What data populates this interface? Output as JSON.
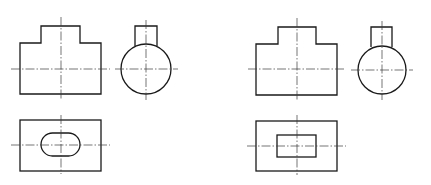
{
  "diagram": {
    "type": "orthographic-projection-comparison",
    "colors": {
      "outline": "#1a1a1a",
      "centerline": "#3a3a3a",
      "background": "#ffffff"
    },
    "drawings": [
      {
        "id": "left",
        "front_view": {
          "body": [
            20,
            43,
            101,
            94
          ],
          "boss": [
            41,
            26,
            80,
            43
          ],
          "cl_h": [
            11,
            69,
            110,
            69
          ],
          "cl_v": [
            61,
            17,
            61,
            99
          ]
        },
        "side_view": {
          "circle": [
            146,
            69,
            25
          ],
          "boss": [
            135,
            26,
            157,
            46
          ],
          "cl_h": [
            115,
            69,
            178,
            69
          ],
          "cl_v": [
            146,
            20,
            146,
            100
          ]
        },
        "top_view": {
          "rect": [
            20,
            120,
            101,
            171
          ],
          "hole": "slot",
          "hole_box": [
            41,
            133,
            80,
            156
          ],
          "cl_h": [
            11,
            145,
            110,
            145
          ],
          "cl_v": [
            61,
            115,
            61,
            174
          ]
        }
      },
      {
        "id": "right",
        "front_view": {
          "body": [
            256,
            44,
            337,
            95
          ],
          "boss": [
            278,
            27,
            316,
            44
          ],
          "cl_h": [
            248,
            69,
            346,
            69
          ],
          "cl_v": [
            297,
            18,
            297,
            100
          ]
        },
        "side_view": {
          "circle": [
            382,
            70,
            24
          ],
          "boss": [
            371,
            27,
            392,
            47
          ],
          "cl_h": [
            351,
            70,
            413,
            70
          ],
          "cl_v": [
            382,
            21,
            382,
            100
          ]
        },
        "top_view": {
          "rect": [
            256,
            121,
            337,
            171
          ],
          "hole": "rectangle",
          "hole_box": [
            277,
            135,
            316,
            157
          ],
          "cl_h": [
            247,
            146,
            346,
            146
          ],
          "cl_v": [
            297,
            115,
            297,
            175
          ]
        }
      }
    ]
  }
}
